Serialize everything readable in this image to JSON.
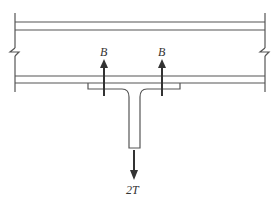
{
  "diagram": {
    "type": "tee-hanger-on-beam free body diagram",
    "labels": {
      "bolt_force_left": "B",
      "bolt_force_right": "B",
      "applied_load": "2T"
    },
    "colors": {
      "line": "#555555",
      "arrow": "#333333"
    }
  }
}
